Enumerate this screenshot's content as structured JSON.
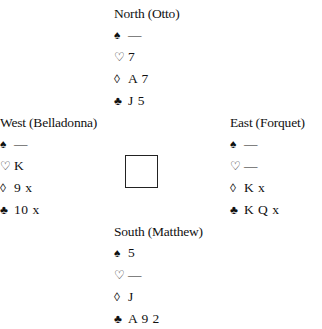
{
  "hands": {
    "north": {
      "title": "North (Otto)",
      "spades": "—",
      "hearts": "7",
      "diamonds": "A 7",
      "clubs": "J 5"
    },
    "west": {
      "title": "West (Belladonna)",
      "spades": "—",
      "hearts": "K",
      "diamonds": "9 x",
      "clubs": "10 x"
    },
    "east": {
      "title": "East (Forquet)",
      "spades": "—",
      "hearts": "—",
      "diamonds": "K x",
      "clubs": "K Q x"
    },
    "south": {
      "title": "South (Matthew)",
      "spades": "5",
      "hearts": "—",
      "diamonds": "J",
      "clubs": "A 9 2"
    }
  },
  "suit_symbols": {
    "spades": "♠",
    "hearts": "♡",
    "diamonds": "◊",
    "clubs": "♣"
  }
}
